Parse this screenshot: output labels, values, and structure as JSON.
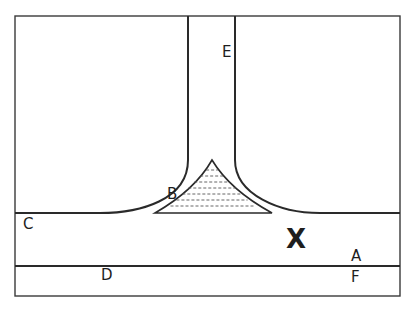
{
  "diagram": {
    "labels": {
      "A": "A",
      "B": "B",
      "C": "C",
      "D": "D",
      "E": "E",
      "F": "F",
      "X": "X"
    },
    "colors": {
      "line": "#2a2a2a",
      "background": "#ffffff"
    }
  }
}
